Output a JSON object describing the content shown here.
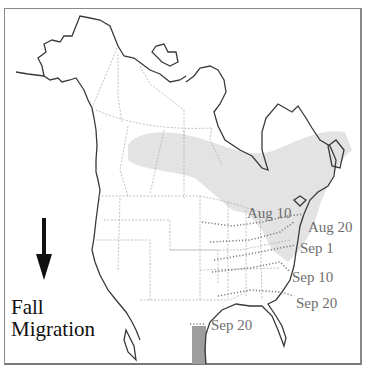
{
  "map": {
    "title_line1": "Fall",
    "title_line2": "Migration",
    "arrow_icon": "down-arrow",
    "colors": {
      "coast": "#3a3a3a",
      "borders": "#9a9a9a",
      "breeding_range": "#e3e3e3",
      "wintering_range": "#9d9d9d",
      "isochrones": "#8a8a8a",
      "labels": "#6e6e6e"
    },
    "isochrones": [
      {
        "label": "Aug 10"
      },
      {
        "label": "Aug 20"
      },
      {
        "label": "Sep 1"
      },
      {
        "label": "Sep 10"
      },
      {
        "label": "Sep 20"
      },
      {
        "label": "Sep 20"
      }
    ]
  }
}
